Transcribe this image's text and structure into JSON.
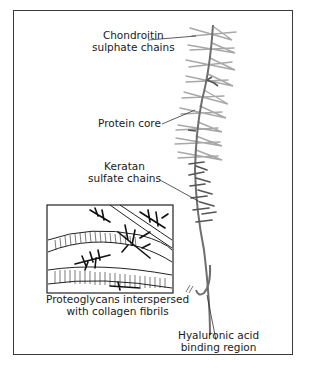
{
  "diagram": {
    "labels": {
      "chondroitin": [
        "Chondroitin",
        "sulphate chains"
      ],
      "protein_core": "Protein core",
      "keratan": [
        "Keratan",
        "sulfate chains"
      ],
      "inset_caption": [
        "Proteoglycans interspersed",
        "with collagen fibrils"
      ],
      "hyaluronic": [
        "Hyaluronic acid",
        "binding region"
      ]
    },
    "colors": {
      "frame": "#3a3a3a",
      "core": "#6e6e6e",
      "chondroitin_chains": "#a8a8a8",
      "keratan_chains": "#555555",
      "text": "#1a1a1a"
    }
  }
}
